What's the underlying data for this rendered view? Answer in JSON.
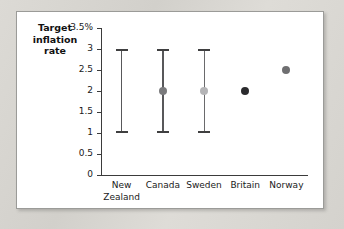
{
  "figure": {
    "axis_title": "Target inflation rate",
    "axis_title_lines": [
      "Target",
      "inflation",
      "rate"
    ]
  },
  "chart_data": {
    "type": "scatter",
    "title": "",
    "subtitle": "",
    "xlabel": "",
    "ylabel": "Target inflation rate",
    "ylim": [
      0,
      3.5
    ],
    "ytick_values": [
      3.5,
      3,
      2.5,
      2,
      1.5,
      1,
      0.5,
      0
    ],
    "ytick_labels": [
      "3.5%",
      "3",
      "2.5",
      "2",
      "1.5",
      "1",
      "0.5",
      "0"
    ],
    "grid": false,
    "legend": "none",
    "categories": [
      "New Zealand",
      "Canada",
      "Sweden",
      "Britain",
      "Norway"
    ],
    "points": [
      {
        "category": "New Zealand",
        "label_lines": [
          "New",
          "Zealand"
        ],
        "target": null,
        "range_low": 1,
        "range_high": 3,
        "has_range": true,
        "has_point": false,
        "color": "#58585a"
      },
      {
        "category": "Canada",
        "label_lines": [
          "Canada"
        ],
        "target": 2,
        "range_low": 1,
        "range_high": 3,
        "has_range": true,
        "has_point": true,
        "color": "#7a7a7c"
      },
      {
        "category": "Sweden",
        "label_lines": [
          "Sweden"
        ],
        "target": 2,
        "range_low": 1,
        "range_high": 3,
        "has_range": true,
        "has_point": true,
        "color": "#b4b4b6"
      },
      {
        "category": "Britain",
        "label_lines": [
          "Britain"
        ],
        "target": 2,
        "range_low": null,
        "range_high": null,
        "has_range": false,
        "has_point": true,
        "color": "#2b2b2d"
      },
      {
        "category": "Norway",
        "label_lines": [
          "Norway"
        ],
        "target": 2.5,
        "range_low": null,
        "range_high": null,
        "has_range": false,
        "has_point": true,
        "color": "#6f6f71"
      }
    ]
  }
}
